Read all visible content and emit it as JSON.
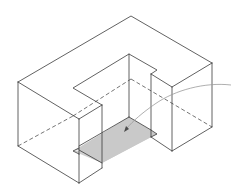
{
  "diagram": {
    "title": "",
    "colors": {
      "background": "#ffffff",
      "edge": "#3a3a3a",
      "shaded_face": "#c8c8c8",
      "leader": "#9a9a9a"
    },
    "labels": []
  }
}
